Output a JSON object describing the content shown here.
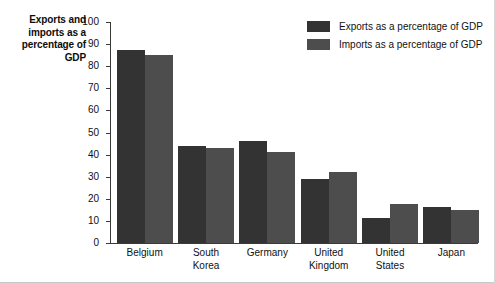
{
  "chart_data": {
    "type": "bar",
    "title": "",
    "ylabel": "Exports and imports as a percentage of GDP",
    "xlabel": "",
    "ylim": [
      0,
      100
    ],
    "yticks": [
      0,
      10,
      20,
      30,
      40,
      50,
      60,
      70,
      80,
      90,
      100
    ],
    "grid": false,
    "legend_position": "top-right",
    "categories": [
      "Belgium",
      "South Korea",
      "Germany",
      "United Kingdom",
      "United States",
      "Japan"
    ],
    "series": [
      {
        "name": "Exports as a percentage of GDP",
        "color": "#333333",
        "values": [
          87.5,
          44,
          46,
          29,
          11.5,
          16.5
        ]
      },
      {
        "name": "Imports as a percentage of GDP",
        "color": "#4d4d4d",
        "values": [
          85,
          43,
          41,
          32,
          17.5,
          15
        ]
      }
    ]
  },
  "axis_title_lines": [
    "Exports and",
    "imports as a",
    "percentage of",
    "GDP"
  ],
  "category_lines": [
    [
      "Belgium"
    ],
    [
      "South",
      "Korea"
    ],
    [
      "Germany"
    ],
    [
      "United",
      "Kingdom"
    ],
    [
      "United",
      "States"
    ],
    [
      "Japan"
    ]
  ],
  "ticklabels": [
    "100",
    "90",
    "80",
    "70",
    "60",
    "50",
    "40",
    "30",
    "20",
    "10",
    "0"
  ]
}
